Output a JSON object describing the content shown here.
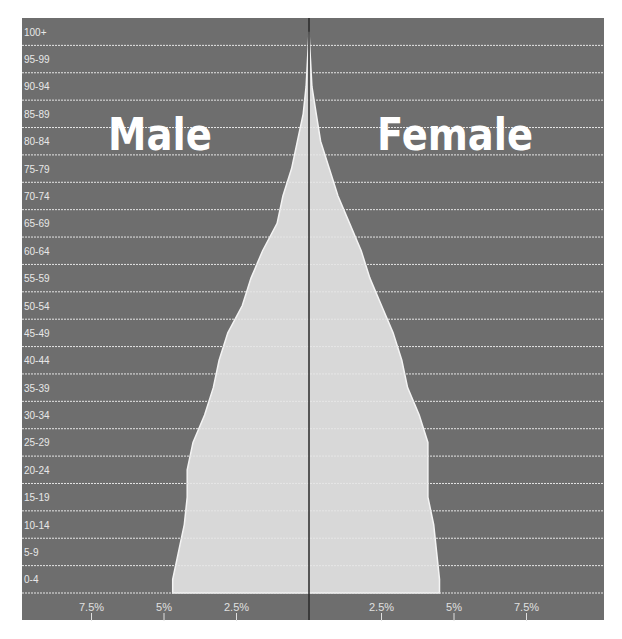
{
  "chart_data": {
    "type": "bar",
    "subtype": "population-pyramid",
    "title": "",
    "series_labels": {
      "left": "Male",
      "right": "Female"
    },
    "categories": [
      "0-4",
      "5-9",
      "10-14",
      "15-19",
      "20-24",
      "25-29",
      "30-34",
      "35-39",
      "40-44",
      "45-49",
      "50-54",
      "55-59",
      "60-64",
      "65-69",
      "70-74",
      "75-79",
      "80-84",
      "85-89",
      "90-94",
      "95-99",
      "100+"
    ],
    "series": [
      {
        "name": "Male",
        "values": [
          4.7,
          4.5,
          4.3,
          4.2,
          4.2,
          4.0,
          3.6,
          3.3,
          3.1,
          2.8,
          2.3,
          2.0,
          1.6,
          1.1,
          0.9,
          0.6,
          0.4,
          0.2,
          0.1,
          0.05,
          0.0
        ]
      },
      {
        "name": "Female",
        "values": [
          4.5,
          4.4,
          4.3,
          4.1,
          4.1,
          4.1,
          3.8,
          3.4,
          3.2,
          2.9,
          2.5,
          2.1,
          1.8,
          1.4,
          1.0,
          0.7,
          0.4,
          0.25,
          0.1,
          0.05,
          0.0
        ]
      }
    ],
    "x_ticks": {
      "left": [
        "7.5%",
        "5%",
        "2.5%"
      ],
      "right": [
        "2.5%",
        "5%",
        "7.5%"
      ]
    },
    "xlabel": "",
    "ylabel": "",
    "xlim": [
      -10,
      10
    ],
    "grid": true,
    "colors": {
      "background": "#6e6e6e",
      "fill": "#d8d8d8",
      "gridline": "#e6e6e6",
      "center_line": "#2a2a2a",
      "text": "#ffffff"
    }
  }
}
